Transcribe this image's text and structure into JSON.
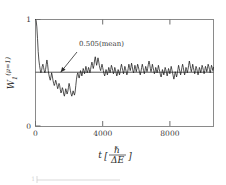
{
  "chart_data": {
    "type": "line",
    "title": "",
    "xlabel": "t[ℏ/ΔE]",
    "ylabel": "W₁^(μ=1)",
    "xlabel_parts": {
      "var": "t",
      "bracket_open": "[",
      "numerator": "ℏ",
      "denominator": "ΔE",
      "bracket_close": "]"
    },
    "ylabel_parts": {
      "symbol": "W",
      "subscript": "1",
      "superscript": "(μ=1)"
    },
    "xlim": [
      0,
      10600
    ],
    "ylim": [
      0,
      1
    ],
    "xticks": [
      0,
      4000,
      8000
    ],
    "xticklabels": [
      "0",
      "4000",
      "8000"
    ],
    "yticks": [
      0,
      1
    ],
    "yticklabels": [
      "0",
      "1"
    ],
    "grid": false,
    "legend": null,
    "annotations": [
      {
        "text": "0.505  (mean)",
        "value_text": "0.505",
        "label_text": "(mean)",
        "points_to_y": 0.505,
        "points_to_x": 1500,
        "text_x": 2400,
        "text_y": 0.79
      }
    ],
    "reference_lines": [
      {
        "name": "mean-line",
        "orientation": "horizontal",
        "value": 0.505,
        "label": "0.505 (mean)"
      }
    ],
    "series": [
      {
        "name": "W1",
        "color": "#1a1a1a",
        "x": [
          0,
          40,
          80,
          120,
          160,
          200,
          240,
          280,
          320,
          360,
          400,
          440,
          480,
          520,
          560,
          600,
          640,
          680,
          720,
          760,
          800,
          840,
          880,
          920,
          960,
          1000,
          1040,
          1080,
          1120,
          1160,
          1200,
          1240,
          1280,
          1320,
          1360,
          1400,
          1440,
          1480,
          1520,
          1560,
          1600,
          1640,
          1680,
          1720,
          1760,
          1800,
          1840,
          1880,
          1920,
          1960,
          2000,
          2040,
          2080,
          2120,
          2160,
          2200,
          2240,
          2280,
          2320,
          2360,
          2400,
          2440,
          2480,
          2520,
          2560,
          2600,
          2640,
          2680,
          2720,
          2760,
          2800,
          2840,
          2880,
          2920,
          2960,
          3000,
          3040,
          3080,
          3120,
          3160,
          3200,
          3240,
          3280,
          3320,
          3360,
          3400,
          3440,
          3480,
          3520,
          3560,
          3600,
          3640,
          3680,
          3720,
          3760,
          3800,
          3840,
          3880,
          3920,
          3960,
          4000,
          4040,
          4080,
          4120,
          4160,
          4200,
          4240,
          4280,
          4320,
          4360,
          4400,
          4440,
          4480,
          4520,
          4560,
          4600,
          4640,
          4680,
          4720,
          4760,
          4800,
          4840,
          4880,
          4920,
          4960,
          5000,
          5040,
          5080,
          5120,
          5160,
          5200,
          5240,
          5280,
          5320,
          5360,
          5400,
          5440,
          5480,
          5520,
          5560,
          5600,
          5640,
          5680,
          5720,
          5760,
          5800,
          5840,
          5880,
          5920,
          5960,
          6000,
          6040,
          6080,
          6120,
          6160,
          6200,
          6240,
          6280,
          6320,
          6360,
          6400,
          6440,
          6480,
          6520,
          6560,
          6600,
          6640,
          6680,
          6720,
          6760,
          6800,
          6840,
          6880,
          6920,
          6960,
          7000,
          7040,
          7080,
          7120,
          7160,
          7200,
          7240,
          7280,
          7320,
          7360,
          7400,
          7440,
          7480,
          7520,
          7560,
          7600,
          7640,
          7680,
          7720,
          7760,
          7800,
          7840,
          7880,
          7920,
          7960,
          8000,
          8040,
          8080,
          8120,
          8160,
          8200,
          8240,
          8280,
          8320,
          8360,
          8400,
          8440,
          8480,
          8520,
          8560,
          8600,
          8640,
          8680,
          8720,
          8760,
          8800,
          8840,
          8880,
          8920,
          8960,
          9000,
          9040,
          9080,
          9120,
          9160,
          9200,
          9240,
          9280,
          9320,
          9360,
          9400,
          9440,
          9480,
          9520,
          9560,
          9600,
          9640,
          9680,
          9720,
          9760,
          9800,
          9840,
          9880,
          9920,
          9960,
          10000,
          10040,
          10080,
          10120,
          10160,
          10200,
          10240,
          10280,
          10320,
          10360,
          10400,
          10440,
          10480,
          10520,
          10560,
          10600
        ],
        "y": [
          1.0,
          0.99,
          0.93,
          0.82,
          0.7,
          0.62,
          0.57,
          0.53,
          0.5,
          0.52,
          0.56,
          0.58,
          0.55,
          0.52,
          0.5,
          0.53,
          0.58,
          0.62,
          0.58,
          0.52,
          0.48,
          0.45,
          0.43,
          0.46,
          0.5,
          0.47,
          0.43,
          0.4,
          0.38,
          0.4,
          0.43,
          0.41,
          0.38,
          0.35,
          0.37,
          0.4,
          0.38,
          0.34,
          0.31,
          0.33,
          0.36,
          0.34,
          0.3,
          0.28,
          0.31,
          0.35,
          0.33,
          0.3,
          0.32,
          0.36,
          0.4,
          0.37,
          0.33,
          0.3,
          0.28,
          0.3,
          0.33,
          0.31,
          0.29,
          0.32,
          0.38,
          0.44,
          0.48,
          0.5,
          0.47,
          0.45,
          0.48,
          0.52,
          0.5,
          0.47,
          0.5,
          0.54,
          0.52,
          0.49,
          0.52,
          0.56,
          0.53,
          0.5,
          0.52,
          0.55,
          0.53,
          0.5,
          0.53,
          0.57,
          0.6,
          0.57,
          0.54,
          0.57,
          0.62,
          0.65,
          0.61,
          0.57,
          0.6,
          0.64,
          0.61,
          0.57,
          0.54,
          0.52,
          0.55,
          0.58,
          0.55,
          0.52,
          0.49,
          0.47,
          0.5,
          0.53,
          0.51,
          0.48,
          0.51,
          0.55,
          0.53,
          0.5,
          0.53,
          0.57,
          0.55,
          0.52,
          0.49,
          0.51,
          0.55,
          0.53,
          0.5,
          0.47,
          0.49,
          0.53,
          0.51,
          0.48,
          0.51,
          0.55,
          0.58,
          0.55,
          0.52,
          0.49,
          0.52,
          0.56,
          0.54,
          0.51,
          0.48,
          0.5,
          0.54,
          0.58,
          0.55,
          0.52,
          0.55,
          0.59,
          0.56,
          0.52,
          0.5,
          0.53,
          0.57,
          0.54,
          0.51,
          0.54,
          0.58,
          0.56,
          0.53,
          0.5,
          0.48,
          0.51,
          0.55,
          0.58,
          0.55,
          0.52,
          0.49,
          0.52,
          0.56,
          0.54,
          0.51,
          0.54,
          0.58,
          0.61,
          0.58,
          0.54,
          0.51,
          0.54,
          0.58,
          0.55,
          0.52,
          0.49,
          0.51,
          0.55,
          0.53,
          0.5,
          0.53,
          0.57,
          0.54,
          0.51,
          0.48,
          0.46,
          0.49,
          0.53,
          0.51,
          0.48,
          0.51,
          0.55,
          0.53,
          0.5,
          0.47,
          0.5,
          0.54,
          0.52,
          0.49,
          0.52,
          0.56,
          0.53,
          0.5,
          0.47,
          0.44,
          0.47,
          0.51,
          0.49,
          0.46,
          0.49,
          0.53,
          0.57,
          0.54,
          0.51,
          0.48,
          0.51,
          0.55,
          0.58,
          0.55,
          0.51,
          0.48,
          0.51,
          0.55,
          0.53,
          0.5,
          0.53,
          0.57,
          0.61,
          0.58,
          0.54,
          0.51,
          0.54,
          0.58,
          0.55,
          0.52,
          0.49,
          0.52,
          0.56,
          0.54,
          0.51,
          0.48,
          0.51,
          0.55,
          0.53,
          0.5,
          0.53,
          0.57,
          0.55,
          0.52,
          0.49,
          0.52,
          0.56,
          0.54,
          0.51,
          0.54,
          0.58,
          0.56,
          0.53,
          0.5,
          0.53,
          0.57,
          0.55,
          0.52,
          0.55
        ]
      }
    ]
  },
  "figure": {
    "axis_color": "#6e6e6e",
    "curve_color": "#1a1a1a",
    "background": "#ffffff"
  }
}
